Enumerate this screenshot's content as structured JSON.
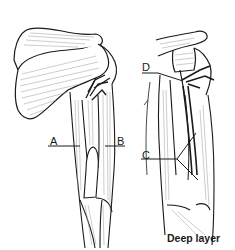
{
  "figure": {
    "type": "anatomical-illustration",
    "panels": [
      {
        "id": "left",
        "description": "superficial view of shoulder and arm"
      },
      {
        "id": "right",
        "description": "deep layer view of shoulder and arm",
        "caption": "Deep layer"
      }
    ],
    "labels": {
      "A": "A",
      "B": "B",
      "C": "C",
      "D": "D"
    },
    "caption": "Deep layer",
    "colors": {
      "line": "#1a1a1a",
      "hatch": "#9a9a9a",
      "background": "#ffffff"
    }
  }
}
